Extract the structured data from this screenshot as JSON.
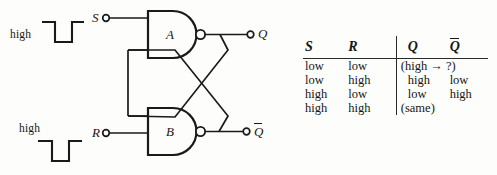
{
  "figure": {
    "type": "sr-latch-nand-logic-diagram",
    "title": ""
  },
  "circuit": {
    "waveforms": [
      {
        "id": "s-waveform",
        "label": "high",
        "label_position": "left",
        "shape": "negative-pulse"
      },
      {
        "id": "r-waveform",
        "label": "high",
        "label_position": "above",
        "shape": "negative-pulse"
      }
    ],
    "terminals": [
      {
        "name": "s-input-terminal",
        "label": "S",
        "kind": "input"
      },
      {
        "name": "r-input-terminal",
        "label": "R",
        "kind": "input"
      },
      {
        "name": "q-output-terminal",
        "label": "Q",
        "overbar": false,
        "kind": "output"
      },
      {
        "name": "qbar-output-terminal",
        "label": "Q",
        "overbar": true,
        "kind": "output"
      }
    ],
    "gates": [
      {
        "name": "nand-gate-a",
        "label": "A",
        "type": "NAND"
      },
      {
        "name": "nand-gate-b",
        "label": "B",
        "type": "NAND"
      }
    ]
  },
  "table": {
    "headers": [
      {
        "label": "S",
        "overbar": false
      },
      {
        "label": "R",
        "overbar": false
      },
      {
        "label": "Q",
        "overbar": false
      },
      {
        "label": "Q",
        "overbar": true
      }
    ],
    "rows": [
      {
        "s": "low",
        "r": "low",
        "q": "(high → ?)",
        "qbar": "",
        "span": true
      },
      {
        "s": "low",
        "r": "high",
        "q": "high",
        "qbar": "low",
        "span": false
      },
      {
        "s": "high",
        "r": "low",
        "q": "low",
        "qbar": "high",
        "span": false
      },
      {
        "s": "high",
        "r": "high",
        "q": "(same)",
        "qbar": "",
        "span": true
      }
    ]
  },
  "colors": {
    "ink": "#161616",
    "rule": "#2a2a2a",
    "background": "#fdfdfb"
  }
}
